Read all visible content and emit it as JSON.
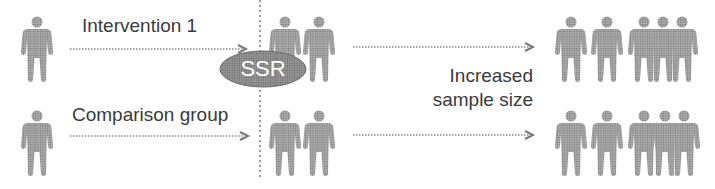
{
  "colors": {
    "person_fill": "#9a9a9a",
    "ssr_fill": "#8c8c8c",
    "text": "#3a3a3a",
    "arrow": "#8a8a8a"
  },
  "labels": {
    "intervention": "Intervention 1",
    "comparison": "Comparison group",
    "ssr": "SSR",
    "increased_line1": "Increased",
    "increased_line2": "sample size"
  },
  "groups": {
    "intervention_initial_count": 1,
    "intervention_interim_count": 2,
    "intervention_final_count": 5,
    "comparison_initial_count": 1,
    "comparison_interim_count": 2,
    "comparison_final_count": 5
  },
  "icons": {
    "person": "person-icon",
    "arrow": "dotted-arrow-right-icon",
    "ssr": "ssr-ellipse"
  }
}
